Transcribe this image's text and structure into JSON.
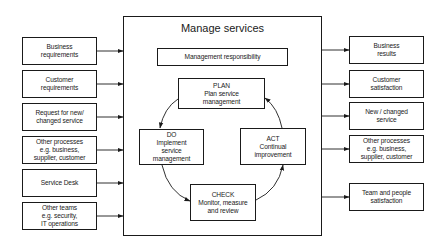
{
  "diagram": {
    "title": "Manage services",
    "management": "Management responsibility",
    "inputs": [
      {
        "label": "Business\nrequirements"
      },
      {
        "label": "Customer\nrequirements"
      },
      {
        "label": "Request for new/\nchanged service"
      },
      {
        "label": "Other processes\ne.g. business,\nsupplier, customer"
      },
      {
        "label": "Service Desk"
      },
      {
        "label": "Other teams\ne.g. security,\nIT operations"
      }
    ],
    "outputs": [
      {
        "label": "Business\nresults"
      },
      {
        "label": "Customer\nsatisfaction"
      },
      {
        "label": "New / changed\nservice"
      },
      {
        "label": "Other processes\ne.g. business,\nsupplier, customer"
      },
      {
        "label": "Team and people\nsatisfaction"
      }
    ],
    "cycle": {
      "plan": "PLAN\nPlan service\nmanagement",
      "do": "DO\nImplement\nservice\nmanagement",
      "check": "CHECK\nMonitor, measure\nand review",
      "act": "ACT\nContinual\nimprovement"
    }
  }
}
